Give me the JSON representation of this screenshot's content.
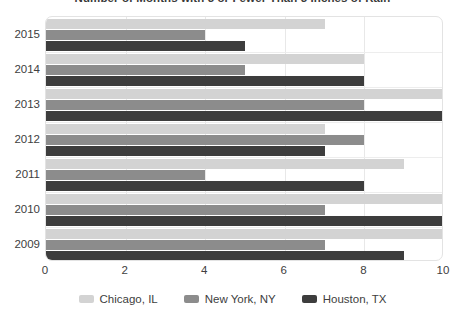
{
  "chart_data": {
    "type": "bar",
    "orientation": "horizontal",
    "title": "Number of Months with 3 or Fewer Than 3 Inches of Rain",
    "xlabel": "",
    "ylabel": "",
    "categories": [
      "2015",
      "2014",
      "2013",
      "2012",
      "2011",
      "2010",
      "2009"
    ],
    "series": [
      {
        "name": "Chicago, IL",
        "color": "#d3d3d3",
        "values": [
          7,
          8,
          10,
          7,
          9,
          10,
          10
        ]
      },
      {
        "name": "New York, NY",
        "color": "#8c8c8c",
        "values": [
          4,
          5,
          8,
          8,
          4,
          7,
          7
        ]
      },
      {
        "name": "Houston, TX",
        "color": "#3d3d3d",
        "values": [
          5,
          8,
          10,
          7,
          8,
          10,
          9
        ]
      }
    ],
    "xlim": [
      0,
      10
    ],
    "xticks": [
      "0",
      "2",
      "4",
      "6",
      "8",
      "10"
    ],
    "xtick_values": [
      0,
      2,
      4,
      6,
      8,
      10
    ],
    "grid": true,
    "legend_position": "bottom"
  }
}
